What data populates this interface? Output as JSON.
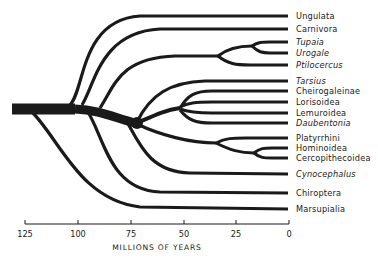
{
  "diagram": {
    "type": "phylogenetic-tree",
    "axis": {
      "title": "MILLIONS OF YEARS",
      "ticks": [
        "125",
        "100",
        "75",
        "50",
        "25",
        "0"
      ]
    },
    "taxa": [
      {
        "name": "Ungulata",
        "italic": false
      },
      {
        "name": "Carnivora",
        "italic": false
      },
      {
        "name": "Tupaia",
        "italic": true
      },
      {
        "name": "Urogale",
        "italic": true
      },
      {
        "name": "Ptilocercus",
        "italic": true
      },
      {
        "name": "Tarsius",
        "italic": true
      },
      {
        "name": "Cheirogaleinae",
        "italic": false
      },
      {
        "name": "Lorisoidea",
        "italic": false
      },
      {
        "name": "Lemuroidea",
        "italic": false
      },
      {
        "name": "Daubentonia",
        "italic": true
      },
      {
        "name": "Platyrrhini",
        "italic": false
      },
      {
        "name": "Hominoidea",
        "italic": false
      },
      {
        "name": "Cercopithecoidea",
        "italic": false
      },
      {
        "name": "Cynocephalus",
        "italic": true
      },
      {
        "name": "Chiroptera",
        "italic": false
      },
      {
        "name": "Marsupialia",
        "italic": false
      }
    ],
    "colors": {
      "ink": "#1a1a1a",
      "background": "#ffffff"
    }
  }
}
